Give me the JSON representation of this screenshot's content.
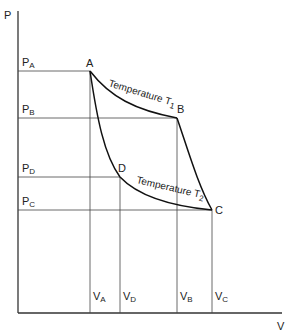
{
  "diagram": {
    "type": "Carnot cycle P-V diagram",
    "axes": {
      "y_label": "P",
      "x_label": "V"
    },
    "points": [
      {
        "name": "A",
        "x": 90,
        "y": 71
      },
      {
        "name": "B",
        "x": 177,
        "y": 118
      },
      {
        "name": "C",
        "x": 212,
        "y": 210
      },
      {
        "name": "D",
        "x": 120,
        "y": 177
      }
    ],
    "pressure_ticks": [
      {
        "main": "P",
        "sub": "A",
        "y": 71
      },
      {
        "main": "P",
        "sub": "B",
        "y": 118
      },
      {
        "main": "P",
        "sub": "D",
        "y": 177
      },
      {
        "main": "P",
        "sub": "C",
        "y": 210
      }
    ],
    "volume_ticks": [
      {
        "main": "V",
        "sub": "A",
        "x": 90
      },
      {
        "main": "V",
        "sub": "D",
        "x": 120
      },
      {
        "main": "V",
        "sub": "B",
        "x": 177
      },
      {
        "main": "V",
        "sub": "C",
        "x": 212
      }
    ],
    "isotherm_labels": {
      "hot": {
        "text": "Temperature T",
        "sub": "1"
      },
      "cold": {
        "text": "Temperature T",
        "sub": "2"
      }
    }
  }
}
